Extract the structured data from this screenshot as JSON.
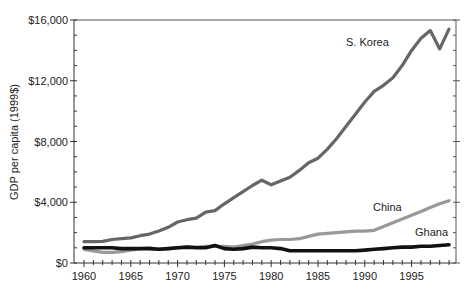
{
  "chart_data": {
    "type": "line",
    "title": "",
    "xlabel": "",
    "ylabel": "GDP per capita (1999$)",
    "xlim": [
      1959,
      2000
    ],
    "ylim": [
      0,
      16000
    ],
    "x_ticks": [
      1960,
      1965,
      1970,
      1975,
      1980,
      1985,
      1990,
      1995
    ],
    "y_ticks": [
      0,
      4000,
      8000,
      12000,
      16000
    ],
    "y_tick_labels": [
      "$0",
      "$4,000",
      "$8,000",
      "$12,000",
      "$16,000"
    ],
    "x_tick_labels": [
      "1960",
      "1965",
      "1970",
      "1975",
      "1980",
      "1985",
      "1990",
      "1995"
    ],
    "grid": false,
    "legend": "inline labels",
    "x": [
      1960,
      1961,
      1962,
      1963,
      1964,
      1965,
      1966,
      1967,
      1968,
      1969,
      1970,
      1971,
      1972,
      1973,
      1974,
      1975,
      1976,
      1977,
      1978,
      1979,
      1980,
      1981,
      1982,
      1983,
      1984,
      1985,
      1986,
      1987,
      1988,
      1989,
      1990,
      1991,
      1992,
      1993,
      1994,
      1995,
      1996,
      1997,
      1998,
      1999
    ],
    "series": [
      {
        "name": "S. Korea",
        "color": "#666666",
        "values": [
          1400,
          1400,
          1420,
          1550,
          1600,
          1650,
          1800,
          1900,
          2100,
          2350,
          2700,
          2850,
          2950,
          3350,
          3450,
          3900,
          4300,
          4700,
          5100,
          5450,
          5150,
          5400,
          5650,
          6100,
          6600,
          6900,
          7500,
          8200,
          9000,
          9800,
          10600,
          11300,
          11700,
          12200,
          13000,
          14000,
          14800,
          15300,
          14100,
          15400
        ]
      },
      {
        "name": "China",
        "color": "#999999",
        "values": [
          900,
          800,
          700,
          700,
          750,
          850,
          950,
          1000,
          900,
          950,
          1000,
          1050,
          1050,
          1100,
          1100,
          1100,
          1050,
          1150,
          1250,
          1400,
          1500,
          1550,
          1550,
          1600,
          1750,
          1900,
          1950,
          2000,
          2050,
          2100,
          2100,
          2150,
          2400,
          2650,
          2900,
          3150,
          3400,
          3650,
          3900,
          4100
        ]
      },
      {
        "name": "Ghana",
        "color": "#111111",
        "values": [
          1000,
          1000,
          1000,
          1000,
          950,
          950,
          950,
          950,
          900,
          950,
          1000,
          1050,
          1000,
          1000,
          1150,
          950,
          900,
          950,
          1050,
          1000,
          1000,
          950,
          800,
          800,
          800,
          800,
          800,
          800,
          800,
          800,
          850,
          900,
          950,
          1000,
          1050,
          1050,
          1100,
          1100,
          1150,
          1200
        ]
      }
    ],
    "annotations": [
      {
        "text": "S. Korea",
        "x": 1988,
        "y": 15200
      },
      {
        "text": "China",
        "x": 1989.5,
        "y": 3700
      },
      {
        "text": "Ghana",
        "x": 1993,
        "y": 1800
      }
    ]
  },
  "labels": {
    "ylabel": "GDP per capita (1999$)",
    "korea": "S. Korea",
    "china": "China",
    "ghana": "Ghana"
  }
}
